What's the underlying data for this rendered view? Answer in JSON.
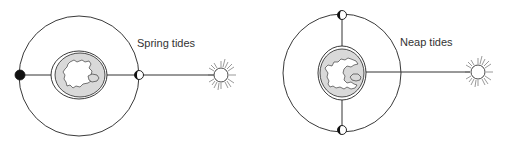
{
  "diagrams": [
    {
      "id": "spring",
      "label": "Spring tides",
      "arrangement": "Sun, Earth and Moon aligned",
      "moon_positions": [
        "new moon (between Earth and Sun side opposite)",
        "full moon"
      ]
    },
    {
      "id": "neap",
      "label": "Neap tides",
      "arrangement": "Moon at right angles to Sun-Earth line",
      "moon_positions": [
        "first quarter",
        "third quarter"
      ]
    }
  ],
  "colors": {
    "line": "#222222",
    "land": "#ffffff",
    "ocean": "#d9d9d9",
    "background": "#ffffff"
  }
}
